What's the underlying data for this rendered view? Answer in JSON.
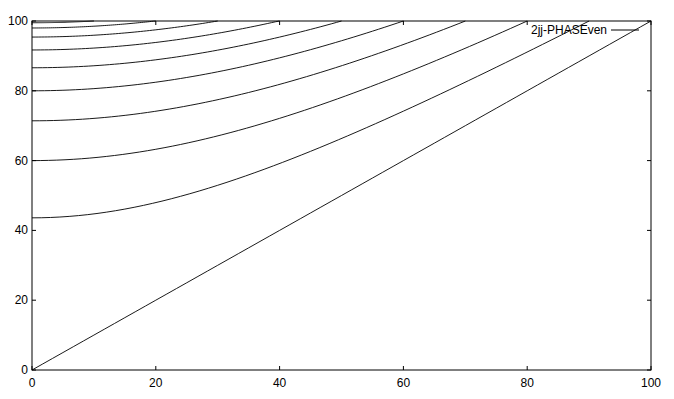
{
  "chart_data": {
    "type": "line",
    "title": "",
    "xlabel": "",
    "ylabel": "",
    "xlim": [
      0,
      100
    ],
    "ylim": [
      0,
      100
    ],
    "xticks": [
      0,
      20,
      40,
      60,
      80,
      100
    ],
    "yticks": [
      0,
      20,
      40,
      60,
      80,
      100
    ],
    "grid": false,
    "legend": {
      "position": "top-right",
      "entries": [
        "2jj-PHASEven"
      ]
    },
    "series": [
      {
        "name": "2jj-PHASEven",
        "description": "family of curves y = sqrt(x^2 + c^2), clipped at y=100, reaching 100 at x = 10,20,...,90, plus the line y = x",
        "curves": [
          {
            "start_y": 99.5,
            "ends_at_x": 10
          },
          {
            "start_y": 98.0,
            "ends_at_x": 20
          },
          {
            "start_y": 95.4,
            "ends_at_x": 30
          },
          {
            "start_y": 91.7,
            "ends_at_x": 40
          },
          {
            "start_y": 86.6,
            "ends_at_x": 50
          },
          {
            "start_y": 80.0,
            "ends_at_x": 60
          },
          {
            "start_y": 71.4,
            "ends_at_x": 70
          },
          {
            "start_y": 60.0,
            "ends_at_x": 80
          },
          {
            "start_y": 43.6,
            "ends_at_x": 90
          },
          {
            "start_y": 0.0,
            "ends_at_x": 100
          }
        ]
      }
    ]
  },
  "legend_label": "2jj-PHASEven"
}
